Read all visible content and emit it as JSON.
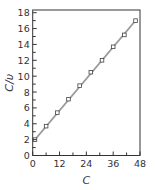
{
  "chart_data": {
    "type": "line",
    "title": "",
    "xlabel": "C",
    "ylabel": "C/υ",
    "xlim": [
      0,
      48
    ],
    "ylim": [
      0,
      18
    ],
    "x_ticks": [
      0,
      12,
      24,
      36,
      48
    ],
    "x_minor_ticks": [
      6,
      18,
      30,
      42
    ],
    "y_ticks": [
      0,
      2,
      4,
      6,
      8,
      10,
      12,
      14,
      16,
      18
    ],
    "y_minor_ticks": [
      1,
      3,
      5,
      7,
      9,
      11,
      13,
      15,
      17
    ],
    "grid": false,
    "legend": null,
    "series": [
      {
        "name": "measured",
        "marker": "open-square",
        "x": [
          1,
          6,
          11,
          16,
          21,
          26,
          31,
          36,
          41,
          46
        ],
        "y": [
          2.0,
          3.7,
          5.4,
          7.1,
          8.8,
          10.5,
          12.0,
          13.7,
          15.2,
          17.0
        ]
      },
      {
        "name": "linear-fit",
        "style": "line",
        "x": [
          1,
          46
        ],
        "y": [
          2.0,
          17.0
        ]
      }
    ],
    "colors": {
      "axis": "#333333",
      "fit_line": "#9a9a9a",
      "marker_edge": "#444444",
      "marker_fill": "#ffffff"
    }
  }
}
